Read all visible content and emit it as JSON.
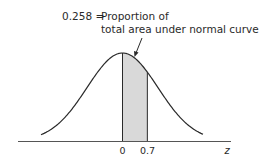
{
  "figure": {
    "annotation": {
      "value": "0.258 =",
      "line1": "Proportion of",
      "line2": "total area under normal curve"
    },
    "axis": {
      "label": "z",
      "ticks": [
        "0",
        "0.7"
      ]
    },
    "shaded_region": {
      "from_z": 0,
      "to_z": 0.7,
      "area": 0.258,
      "fill": "#d9d9d9"
    },
    "colors": {
      "curve": "#2a2a2a",
      "baseline": "#555555",
      "shade": "#d9d9d9"
    }
  },
  "chart_data": {
    "type": "area",
    "title": "0.258 = Proportion of total area under normal curve",
    "xlabel": "z",
    "ylabel": "",
    "distribution": "standard normal",
    "shaded_interval": [
      0,
      0.7
    ],
    "shaded_area": 0.258,
    "x_tick_labels": [
      "0",
      "0.7"
    ],
    "xlim": [
      -3.0,
      3.0
    ],
    "grid": false,
    "legend": "none"
  }
}
